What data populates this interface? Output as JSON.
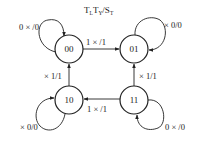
{
  "title": {
    "parts": [
      {
        "text": "T",
        "sub": "L"
      },
      {
        "text": "T",
        "sub": "Y"
      },
      {
        "text": "/S",
        "sub": "T"
      }
    ]
  },
  "states": [
    {
      "id": "00",
      "label": "00",
      "cx": 69,
      "cy": 49
    },
    {
      "id": "01",
      "label": "01",
      "cx": 134,
      "cy": 49
    },
    {
      "id": "10",
      "label": "10",
      "cx": 69,
      "cy": 100
    },
    {
      "id": "11",
      "label": "11",
      "cx": 134,
      "cy": 100
    }
  ],
  "transitions": [
    {
      "from": "00",
      "to": "00",
      "label": "0 × /0"
    },
    {
      "from": "00",
      "to": "01",
      "label": "1 × /1"
    },
    {
      "from": "01",
      "to": "01",
      "label": "× 0/0"
    },
    {
      "from": "10",
      "to": "00",
      "label": "× 1/1"
    },
    {
      "from": "11",
      "to": "01",
      "label": "× 1/1"
    },
    {
      "from": "11",
      "to": "10",
      "label": "1 × /1"
    },
    {
      "from": "10",
      "to": "10",
      "label": "× 0/0"
    },
    {
      "from": "11",
      "to": "11",
      "label": "0 × /0"
    }
  ],
  "colors": {
    "stroke": "#222222",
    "text": "#222222",
    "background": "#ffffff"
  }
}
